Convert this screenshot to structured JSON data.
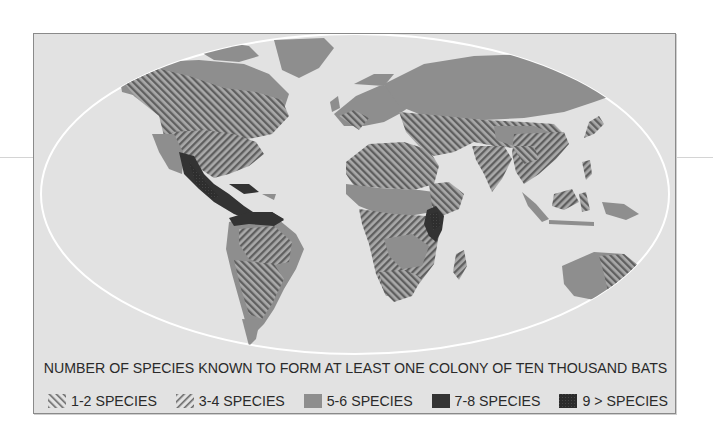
{
  "map": {
    "title": "NUMBER OF SPECIES KNOWN TO FORM AT LEAST ONE COLONY OF TEN THOUSAND BATS",
    "projection_outline": "ellipse",
    "background_color": "#e2e2e2",
    "outline_color": "#ffffff",
    "regions_by_class": {
      "1-2 SPECIES": [
        "Canada (south)",
        "northern USA",
        "southern South America",
        "Sahara/North Africa",
        "southern Africa",
        "Middle East",
        "Central Asia",
        "southern China",
        "eastern Australia",
        "Japan"
      ],
      "3-4 SPECIES": [
        "central & southern USA",
        "Brazil",
        "West/Central Africa (south)",
        "Madagascar",
        "India",
        "Southeast Asia",
        "northern Australia"
      ],
      "5-6 SPECIES": [
        "Alaska/northern Canada",
        "Greenland",
        "northern Mexico",
        "Europe",
        "Russia/Siberia",
        "Sahel",
        "Argentina (south)",
        "Western Australia",
        "Indonesia",
        "New Guinea",
        "New Zealand"
      ],
      "7-8 SPECIES": [
        "Mexico",
        "Central America",
        "northern South America",
        "East Africa (Kenya/Uganda)"
      ],
      "9 > SPECIES": [
        "Central American highlands",
        "East African rift"
      ]
    }
  },
  "legend": {
    "items": [
      {
        "label": "1-2 SPECIES",
        "pattern": "hatch-forward",
        "color": "#7d7d7d"
      },
      {
        "label": "3-4 SPECIES",
        "pattern": "hatch-back",
        "color": "#7d7d7d"
      },
      {
        "label": "5-6 SPECIES",
        "pattern": "solid",
        "color": "#8e8e8e"
      },
      {
        "label": "7-8 SPECIES",
        "pattern": "solid",
        "color": "#333333"
      },
      {
        "label": "9 > SPECIES",
        "pattern": "solid-textured",
        "color": "#2b2b2b"
      }
    ]
  }
}
